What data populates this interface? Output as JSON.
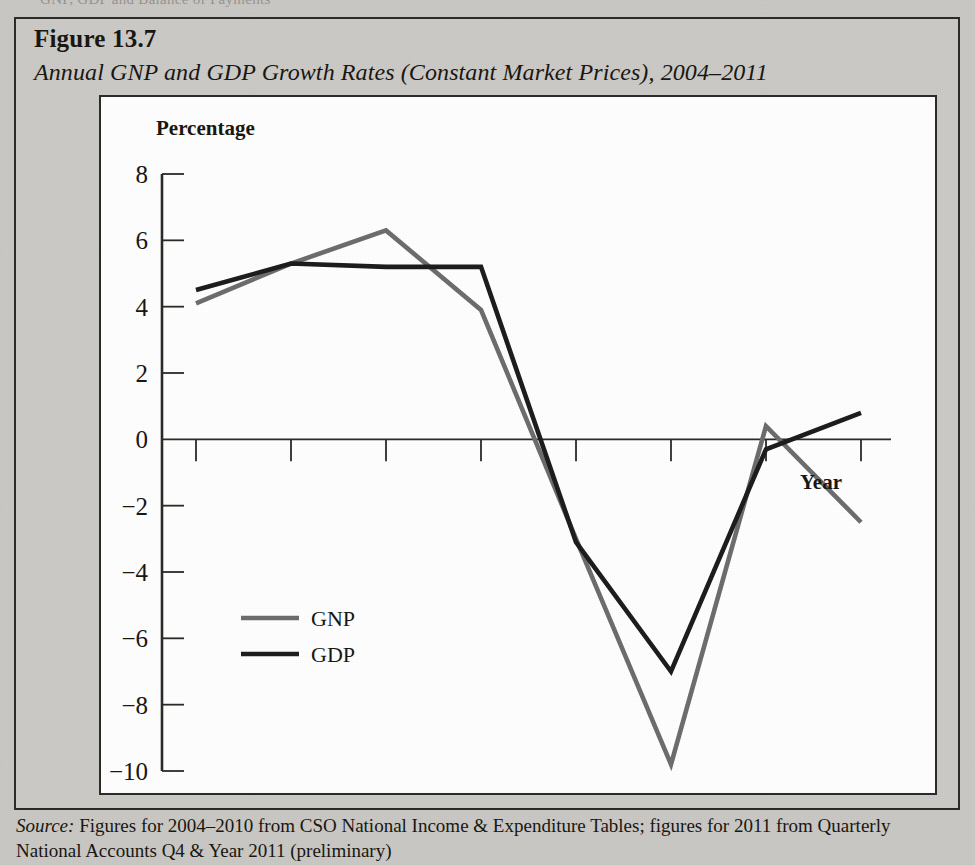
{
  "page": {
    "bleed_text": "GNP, GDP and Balance of Payments",
    "background_color": "#c9c7c3",
    "panel_color": "#ffffff",
    "border_color": "#2a2825"
  },
  "figure": {
    "number_label": "Figure 13.7",
    "caption": "Annual GNP and GDP Growth Rates (Constant Market Prices), 2004–2011",
    "source_label": "Source:",
    "source_text": " Figures for 2004–2010 from CSO National Income & Expenditure Tables; figures for 2011 from Quarterly National Accounts Q4 & Year 2011 (preliminary)"
  },
  "chart_data": {
    "type": "line",
    "title": "Annual GNP and GDP Growth Rates (Constant Market Prices), 2004–2011",
    "xlabel": "Year",
    "ylabel": "Percentage",
    "categories": [
      "2004",
      "2005",
      "2006",
      "2007",
      "2008",
      "2009",
      "2010",
      "2011"
    ],
    "x": [
      2004,
      2005,
      2006,
      2007,
      2008,
      2009,
      2010,
      2011
    ],
    "ylim": [
      -10,
      8
    ],
    "yticks": [
      8,
      6,
      4,
      2,
      0,
      -2,
      -4,
      -6,
      -8,
      -10
    ],
    "ytick_labels": [
      "8",
      "6",
      "4",
      "2",
      "0",
      "−2",
      "−4",
      "−6",
      "−8",
      "−10"
    ],
    "grid": false,
    "legend_position": "inside-lower-left",
    "series": [
      {
        "name": "GNP",
        "color": "#6b6b6b",
        "values": [
          4.1,
          5.3,
          6.3,
          3.9,
          -3.0,
          -9.8,
          0.4,
          -2.5
        ]
      },
      {
        "name": "GDP",
        "color": "#1a1a1a",
        "values": [
          4.5,
          5.3,
          5.2,
          5.2,
          -3.1,
          -7.0,
          -0.3,
          0.8
        ]
      }
    ]
  }
}
